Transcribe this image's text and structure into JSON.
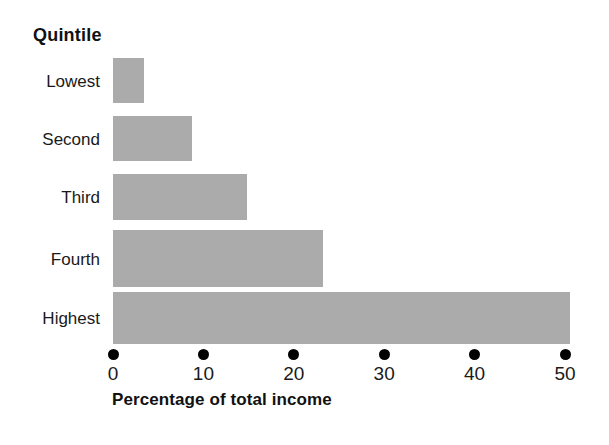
{
  "chart_data": {
    "type": "bar",
    "orientation": "horizontal",
    "title": "",
    "category_axis_title": "Quintile",
    "xlabel": "Percentage of total income",
    "ylabel": "Quintile",
    "categories": [
      "Lowest",
      "Second",
      "Third",
      "Fourth",
      "Highest"
    ],
    "values": [
      3.4,
      8.7,
      14.8,
      23.2,
      50.5
    ],
    "series": [
      {
        "name": "Percentage of total income",
        "values": [
          3.4,
          8.7,
          14.8,
          23.2,
          50.5
        ]
      }
    ],
    "xlim": [
      0,
      50
    ],
    "x_ticks": [
      0,
      10,
      20,
      30,
      40,
      50
    ],
    "x_tick_labels": [
      "0",
      "10",
      "20",
      "30",
      "40",
      "50"
    ],
    "grid": false,
    "legend": false,
    "bar_color": "#ababab",
    "tick_marker": "filled-circle",
    "text_color": "#111111"
  },
  "axis": {
    "title": "Percentage of total income",
    "ticks": [
      {
        "label": "0",
        "value": 0
      },
      {
        "label": "10",
        "value": 10
      },
      {
        "label": "20",
        "value": 20
      },
      {
        "label": "30",
        "value": 30
      },
      {
        "label": "40",
        "value": 40
      },
      {
        "label": "50",
        "value": 50
      }
    ]
  },
  "category_header": "Quintile",
  "bars": [
    {
      "label": "Lowest",
      "value": 3.4
    },
    {
      "label": "Second",
      "value": 8.7
    },
    {
      "label": "Third",
      "value": 14.8
    },
    {
      "label": "Fourth",
      "value": 23.2
    },
    {
      "label": "Highest",
      "value": 50.5
    }
  ]
}
